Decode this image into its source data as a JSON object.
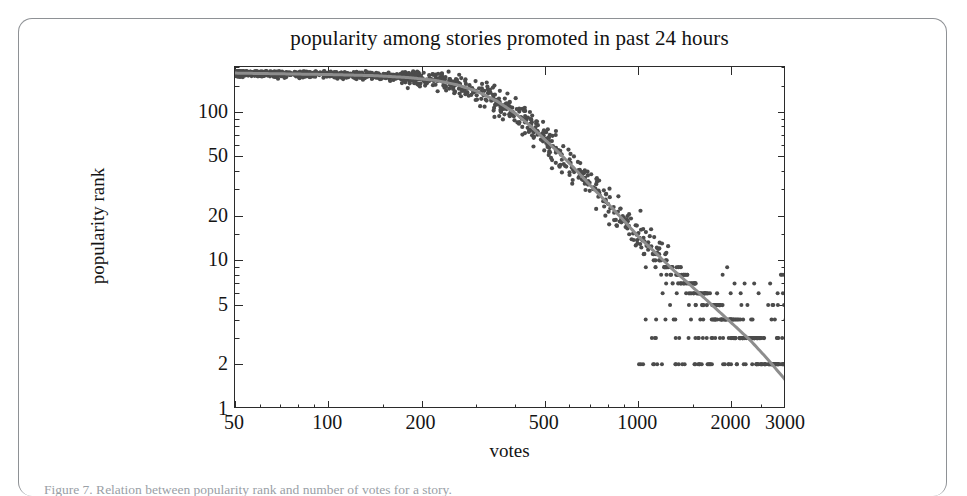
{
  "figure": {
    "title": "popularity among stories promoted in past 24 hours",
    "xaxis_title": "votes",
    "yaxis_title": "popularity rank",
    "caption": "Figure 7. Relation between popularity rank and number of votes for a story."
  },
  "colors": {
    "point": "#4b4b4b",
    "trend_line": "#8d8d8d",
    "axis": "#2b2b2b",
    "text": "#141414",
    "page_border": "#8e9195",
    "background": "#ffffff"
  },
  "chart_data": {
    "type": "scatter",
    "title": "popularity among stories promoted in past 24 hours",
    "xlabel": "votes",
    "ylabel": "popularity rank",
    "xscale": "log",
    "yscale": "log",
    "xlim": [
      50,
      3000
    ],
    "ylim": [
      1,
      200
    ],
    "grid": false,
    "legend": null,
    "xticks": [
      50,
      100,
      200,
      500,
      1000,
      2000,
      3000
    ],
    "xtick_labels": [
      "50",
      "100",
      "200",
      "500",
      "1000",
      "2000",
      "3000"
    ],
    "yticks": [
      1,
      2,
      5,
      10,
      20,
      50,
      100
    ],
    "ytick_labels": [
      "1",
      "2",
      "5",
      "10",
      "20",
      "50",
      "100"
    ],
    "series": [
      {
        "name": "stories",
        "kind": "scatter",
        "marker": "filled-circle",
        "marker_size": 4,
        "color": "#4b4b4b",
        "n_points": 1400,
        "description": "Popularity rank versus vote count for stories promoted in the past 24 hours; dense saturated band near rank 150-200 for low vote counts, falling steeply above roughly 300 votes, with discrete integer rank bands visible below rank 10."
      },
      {
        "name": "trend",
        "kind": "line",
        "color": "#8d8d8d",
        "linewidth": 3,
        "description": "Smooth fitted trend curve: flat near rank 180 up to about 250 votes, then decreasing approximately as a power law to rank 1.5 near 3000 votes.",
        "points": [
          {
            "x": 50,
            "y": 182
          },
          {
            "x": 70,
            "y": 180
          },
          {
            "x": 100,
            "y": 178
          },
          {
            "x": 140,
            "y": 175
          },
          {
            "x": 180,
            "y": 170
          },
          {
            "x": 220,
            "y": 163
          },
          {
            "x": 260,
            "y": 152
          },
          {
            "x": 300,
            "y": 138
          },
          {
            "x": 350,
            "y": 118
          },
          {
            "x": 400,
            "y": 98
          },
          {
            "x": 450,
            "y": 80
          },
          {
            "x": 500,
            "y": 65
          },
          {
            "x": 560,
            "y": 52
          },
          {
            "x": 620,
            "y": 42
          },
          {
            "x": 700,
            "y": 32
          },
          {
            "x": 800,
            "y": 24
          },
          {
            "x": 900,
            "y": 18.5
          },
          {
            "x": 1000,
            "y": 14.5
          },
          {
            "x": 1150,
            "y": 11
          },
          {
            "x": 1300,
            "y": 8.6
          },
          {
            "x": 1500,
            "y": 6.6
          },
          {
            "x": 1750,
            "y": 4.9
          },
          {
            "x": 2000,
            "y": 3.8
          },
          {
            "x": 2300,
            "y": 2.9
          },
          {
            "x": 2600,
            "y": 2.2
          },
          {
            "x": 3000,
            "y": 1.55
          }
        ]
      }
    ]
  }
}
